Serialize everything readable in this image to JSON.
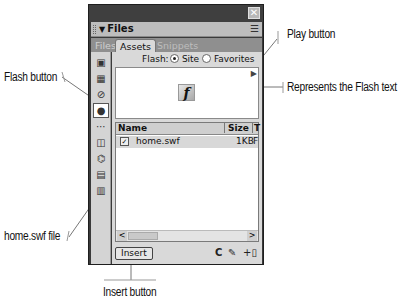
{
  "panel": {
    "close_icon": "✕",
    "title": "Files",
    "title_arrow": "▼",
    "options_icon": "☰",
    "tabs": [
      {
        "label": "Files",
        "active": false
      },
      {
        "label": "Assets",
        "active": true
      },
      {
        "label": "Snippets",
        "active": false
      }
    ],
    "sidebar": [
      {
        "name": "images-icon",
        "glyph": "▣"
      },
      {
        "name": "colors-icon",
        "glyph": "▦"
      },
      {
        "name": "urls-icon",
        "glyph": "⊘"
      },
      {
        "name": "flash-icon",
        "glyph": "●",
        "active": true
      },
      {
        "name": "shockwave-icon",
        "glyph": "⋯"
      },
      {
        "name": "movies-icon",
        "glyph": "◫"
      },
      {
        "name": "scripts-icon",
        "glyph": "⌬"
      },
      {
        "name": "templates-icon",
        "glyph": "▤"
      },
      {
        "name": "library-icon",
        "glyph": "▥"
      }
    ],
    "flash_filter": {
      "label": "Flash:",
      "options": [
        {
          "label": "Site",
          "selected": true
        },
        {
          "label": "Favorites",
          "selected": false
        }
      ]
    },
    "preview": {
      "play_icon": "▶",
      "flash_glyph": "f"
    },
    "list": {
      "columns": [
        "Name",
        "Size",
        "T"
      ],
      "rows": [
        {
          "name": "home.swf",
          "size": "1KB",
          "type": "F"
        }
      ]
    },
    "scroll": {
      "left": "<",
      "right": ">"
    },
    "footer": {
      "insert_label": "Insert",
      "refresh_icon": "C",
      "edit_icon": "✎",
      "add_favorite_icon": "+▯"
    }
  },
  "callouts": {
    "play_button": "Play button",
    "flash_text": "Represents the Flash text",
    "flash_button": "Flash button",
    "home_swf": "home.swf file",
    "insert_button": "Insert button"
  }
}
